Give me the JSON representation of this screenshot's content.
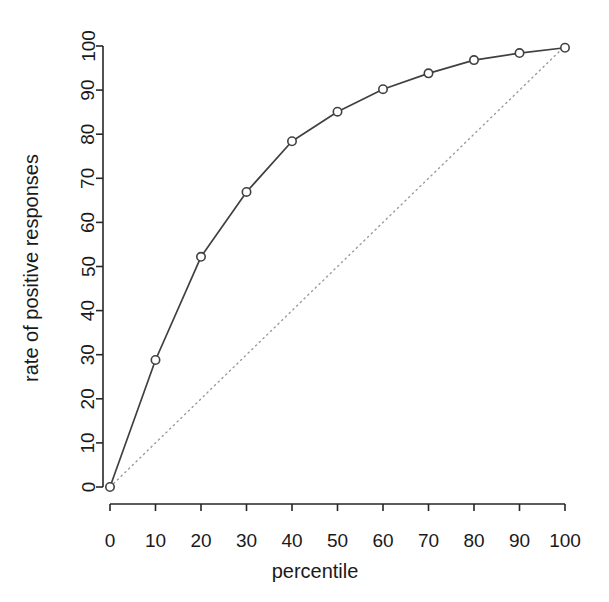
{
  "chart_data": {
    "type": "line",
    "title": "",
    "subtitle": "",
    "xlabel": "percentile",
    "ylabel": "rate of positive responses",
    "xlim": [
      0,
      100
    ],
    "ylim": [
      0,
      100
    ],
    "xticks": [
      0,
      10,
      20,
      30,
      40,
      50,
      60,
      70,
      80,
      90,
      100
    ],
    "yticks": [
      0,
      10,
      20,
      30,
      40,
      50,
      60,
      70,
      80,
      90,
      100
    ],
    "xtick_labels": [
      "0",
      "10",
      "20",
      "30",
      "40",
      "50",
      "60",
      "70",
      "80",
      "90",
      "100"
    ],
    "ytick_labels": [
      "0",
      "10",
      "20",
      "30",
      "40",
      "50",
      "60",
      "70",
      "80",
      "90",
      "100"
    ],
    "grid": false,
    "legend": false,
    "legend_position": "none",
    "x": [
      0,
      10,
      20,
      30,
      40,
      50,
      60,
      70,
      80,
      90,
      100
    ],
    "series": [
      {
        "name": "gain curve",
        "type": "line",
        "marker": "open-circle",
        "linestyle": "solid",
        "color": "#404040",
        "values": [
          0,
          28.8,
          52.2,
          66.9,
          78.4,
          85.1,
          90.2,
          93.8,
          96.8,
          98.4,
          99.6
        ]
      },
      {
        "name": "baseline diagonal",
        "type": "line",
        "marker": "none",
        "linestyle": "dotted",
        "color": "#9a9a9a",
        "values": [
          0,
          10,
          20,
          30,
          40,
          50,
          60,
          70,
          80,
          90,
          100
        ]
      }
    ]
  },
  "axes": {
    "x_axis_label": "percentile",
    "y_axis_label": "rate of positive responses"
  }
}
